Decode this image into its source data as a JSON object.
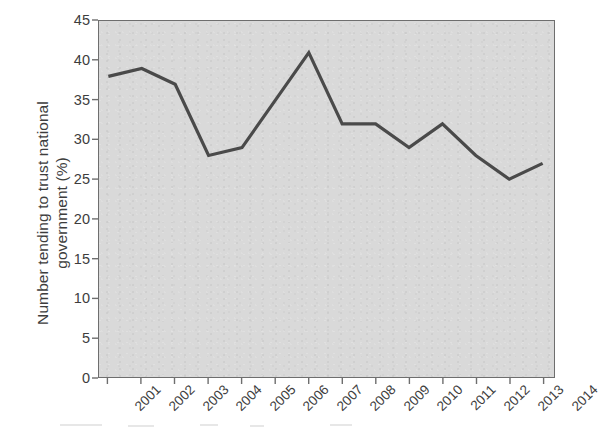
{
  "chart_data": {
    "type": "line",
    "title": "",
    "subtitle": "",
    "xlabel": "",
    "ylabel": "Number tending to trust national government (%)",
    "ylabel_line1": "Number tending to trust national",
    "ylabel_line2": "government (%)",
    "categories": [
      "2001",
      "2002",
      "2003",
      "2004",
      "2005",
      "2006",
      "2007",
      "2008",
      "2009",
      "2010",
      "2011",
      "2012",
      "2013",
      "2014"
    ],
    "values": [
      38,
      39,
      37,
      28,
      29,
      35,
      41,
      32,
      32,
      29,
      32,
      28,
      25,
      27
    ],
    "series": [
      {
        "name": "Trust in national government",
        "values": [
          38,
          39,
          37,
          28,
          29,
          35,
          41,
          32,
          32,
          29,
          32,
          28,
          25,
          27
        ]
      }
    ],
    "ylim": [
      0,
      45
    ],
    "y_ticks": [
      0,
      5,
      10,
      15,
      20,
      25,
      30,
      35,
      40,
      45
    ],
    "y_tick_labels": [
      "0",
      "5",
      "10",
      "15",
      "20",
      "25",
      "30",
      "35",
      "40",
      "45"
    ],
    "x_tick_labels": [
      "2001",
      "2002",
      "2003",
      "2004",
      "2005",
      "2006",
      "2007",
      "2008",
      "2009",
      "2010",
      "2011",
      "2012",
      "2013",
      "2014"
    ],
    "x_tick_rotation": -45,
    "grid": false,
    "legend": false,
    "legend_position": "none",
    "annotations": [],
    "colors": {
      "line": "#4a4a4a",
      "plot_background": "#d9d9d9",
      "figure_background": "#ffffff",
      "axis": "#6e6e6e",
      "text": "#3d3d3d"
    },
    "line_width": 3.2
  }
}
